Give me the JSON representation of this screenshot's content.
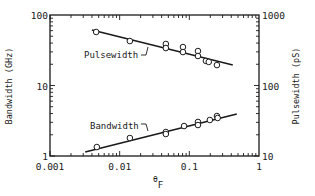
{
  "chart_data": {
    "type": "scatter",
    "title": "",
    "xlabel": "θF",
    "xlabel_main": "θ",
    "xlabel_sub": "F",
    "ylabel": "Bandwidth (GHz)",
    "y2label": "Pulsewidth (pS)",
    "xscale": "log",
    "yscale": "log",
    "xlim": [
      0.001,
      1
    ],
    "ylim": [
      1,
      100
    ],
    "y2lim": [
      10,
      1000
    ],
    "x_tick_labels": [
      "0.001",
      "0.01",
      "0.1",
      "1"
    ],
    "y_tick_labels": [
      "1",
      "10",
      "100"
    ],
    "y2_tick_labels": [
      "10",
      "100",
      "1000"
    ],
    "grid": false,
    "legend": "inline labels",
    "series": [
      {
        "name": "Pulsewidth",
        "axis": "right",
        "unit": "ps",
        "marker": "open-circle",
        "points": [
          {
            "x": 0.0046,
            "y": 574
          },
          {
            "x": 0.014,
            "y": 427
          },
          {
            "x": 0.046,
            "y": 388
          },
          {
            "x": 0.046,
            "y": 340
          },
          {
            "x": 0.081,
            "y": 351
          },
          {
            "x": 0.081,
            "y": 298
          },
          {
            "x": 0.133,
            "y": 308
          },
          {
            "x": 0.133,
            "y": 262
          },
          {
            "x": 0.173,
            "y": 223
          },
          {
            "x": 0.19,
            "y": 216
          },
          {
            "x": 0.249,
            "y": 195
          }
        ],
        "fit_line": [
          {
            "x": 0.004,
            "y": 612
          },
          {
            "x": 0.42,
            "y": 195
          }
        ]
      },
      {
        "name": "Bandwidth",
        "axis": "left",
        "unit": "GHz",
        "marker": "open-circle",
        "points": [
          {
            "x": 0.0047,
            "y": 1.34
          },
          {
            "x": 0.014,
            "y": 1.8
          },
          {
            "x": 0.046,
            "y": 2.19
          },
          {
            "x": 0.046,
            "y": 2.05
          },
          {
            "x": 0.084,
            "y": 2.66
          },
          {
            "x": 0.133,
            "y": 3.04
          },
          {
            "x": 0.133,
            "y": 2.75
          },
          {
            "x": 0.197,
            "y": 3.24
          },
          {
            "x": 0.249,
            "y": 3.69
          },
          {
            "x": 0.255,
            "y": 3.46
          }
        ],
        "fit_line": [
          {
            "x": 0.0032,
            "y": 1.14
          },
          {
            "x": 0.48,
            "y": 3.94
          }
        ]
      }
    ]
  }
}
